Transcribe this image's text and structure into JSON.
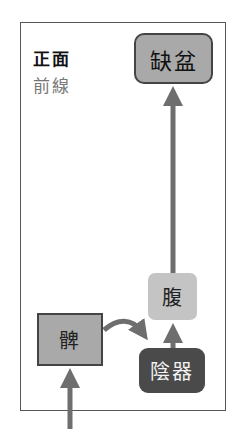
{
  "labels": {
    "view": "正面",
    "line": "前線"
  },
  "nodes": {
    "top": "缺盆",
    "middle": "腹",
    "left": "髀",
    "bottom": "陰器"
  },
  "colors": {
    "arrow": "#6e6e6e",
    "node_medium": "#a9a9a9",
    "node_light": "#c4c4c4",
    "node_dark": "#4a4a4a",
    "frame": "#555555"
  }
}
